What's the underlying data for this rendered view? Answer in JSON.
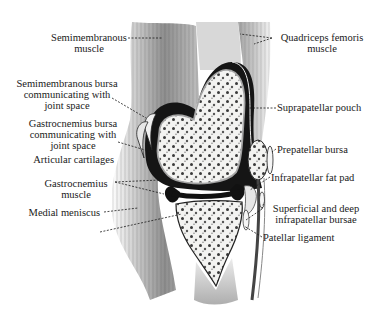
{
  "diagram": {
    "labels_left": [
      {
        "id": "semimembranous-muscle",
        "lines": [
          "Semimembranous",
          "muscle"
        ]
      },
      {
        "id": "semimembranous-bursa",
        "lines": [
          "Semimembranous bursa",
          "communicating with",
          "joint space"
        ]
      },
      {
        "id": "gastrocnemius-bursa",
        "lines": [
          "Gastrocnemius bursa",
          "communicating with",
          "joint space"
        ]
      },
      {
        "id": "articular-cartilages",
        "lines": [
          "Articular cartilages"
        ]
      },
      {
        "id": "gastrocnemius-muscle",
        "lines": [
          "Gastrocnemius",
          "muscle"
        ]
      },
      {
        "id": "medial-meniscus",
        "lines": [
          "Medial meniscus"
        ]
      }
    ],
    "labels_right": [
      {
        "id": "quadriceps-femoris-muscle",
        "lines": [
          "Quadriceps femoris",
          "muscle"
        ]
      },
      {
        "id": "suprapatellar-pouch",
        "lines": [
          "Suprapatellar pouch"
        ]
      },
      {
        "id": "prepatellar-bursa",
        "lines": [
          "Prepatellar bursa"
        ]
      },
      {
        "id": "infrapatellar-fat-pad",
        "lines": [
          "Infrapatellar fat pad"
        ]
      },
      {
        "id": "superficial-deep-infrapatellar-bursae",
        "lines": [
          "Superficial and deep",
          "infrapatellar bursae"
        ]
      },
      {
        "id": "patellar-ligament",
        "lines": [
          "Patellar ligament"
        ]
      }
    ],
    "colors": {
      "ink": "#1a1a1a",
      "bone_fill": "#f4f4f2",
      "cavity": "#151515",
      "muscle": "#8a8a8a",
      "background": "#ffffff"
    }
  }
}
